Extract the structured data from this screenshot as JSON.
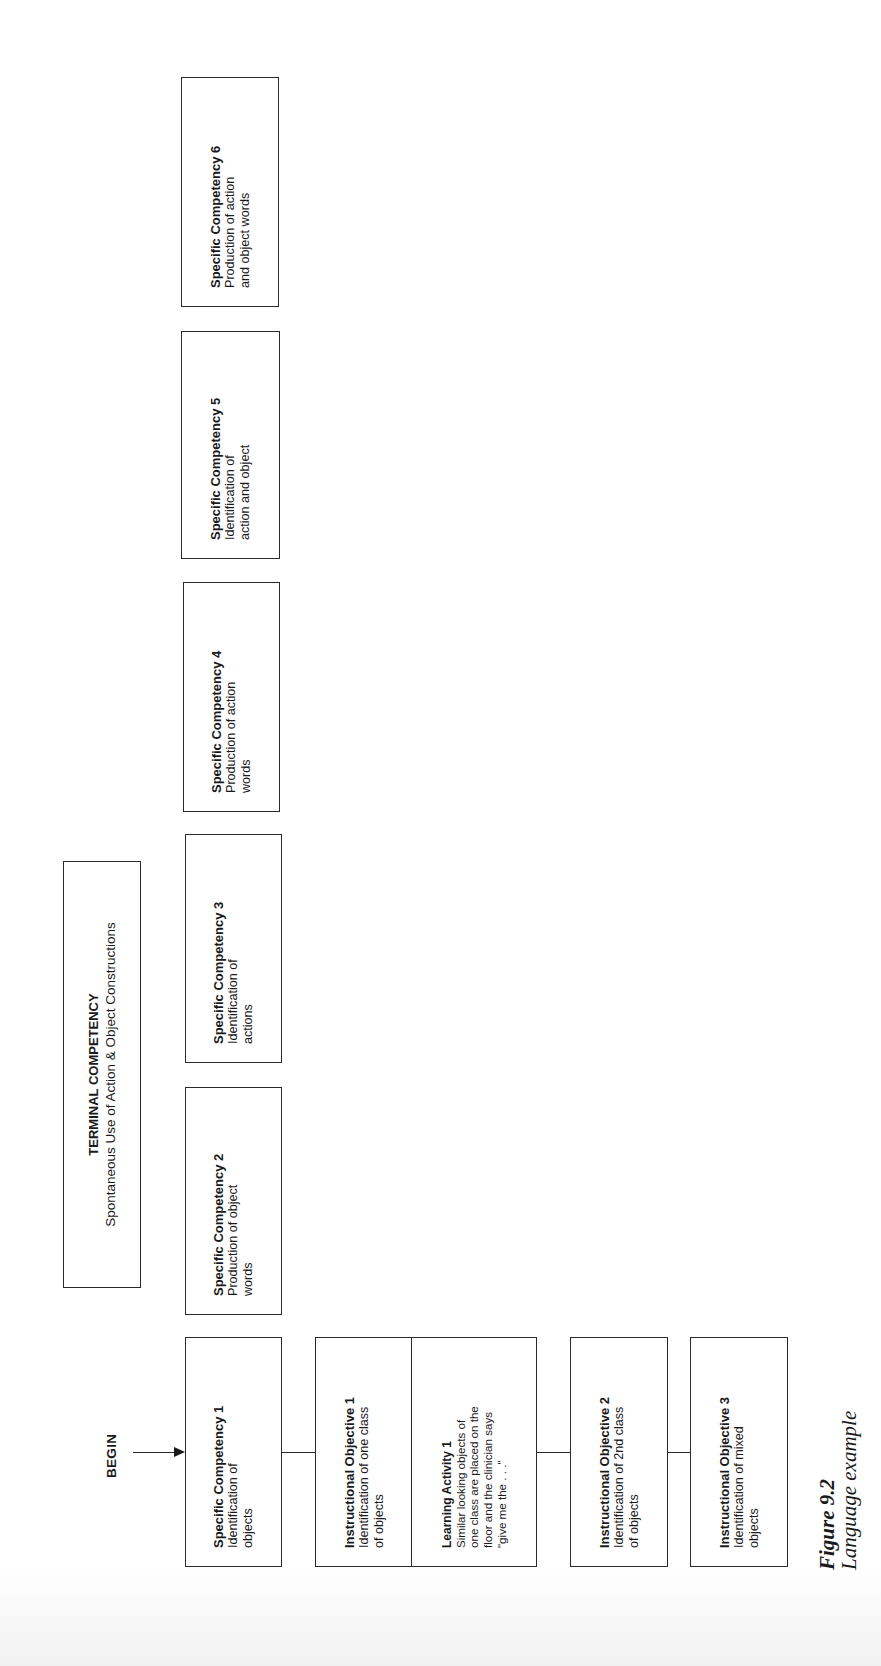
{
  "diagram": {
    "terminal": {
      "title": "TERMINAL COMPETENCY",
      "desc": "Spontaneous Use of Action & Object Constructions"
    },
    "begin_label": "BEGIN",
    "specific_competencies": [
      {
        "title": "Specific Competency 1",
        "desc": "Identification of\nobjects"
      },
      {
        "title": "Specific Competency 2",
        "desc": "Production of object\nwords"
      },
      {
        "title": "Specific Competency 3",
        "desc": "Identification of\nactions"
      },
      {
        "title": "Specific Competency 4",
        "desc": "Production of action\nwords"
      },
      {
        "title": "Specific Competency 5",
        "desc": "Identification of\naction and object"
      },
      {
        "title": "Specific Competency 6",
        "desc": "Production of action\nand object words"
      }
    ],
    "instructional_objectives": [
      {
        "title": "Instructional Objective 1",
        "desc": "Identification of one class\nof objects"
      },
      {
        "title": "Instructional Objective 2",
        "desc": "Identification of 2nd class\nof objects"
      },
      {
        "title": "Instructional Objective 3",
        "desc": "Identification of mixed\nobjects"
      }
    ],
    "learning_activity": {
      "title": "Learning Activity 1",
      "desc": "Similar looking objects of\none class are placed on the\nfloor and the clinician says\n\"give me the . . .\""
    },
    "colors": {
      "line": "#2a2a2a",
      "text": "#1a1a1a",
      "background": "#ffffff"
    }
  },
  "caption": {
    "figure": "Figure 9.2",
    "title": "Language example"
  }
}
